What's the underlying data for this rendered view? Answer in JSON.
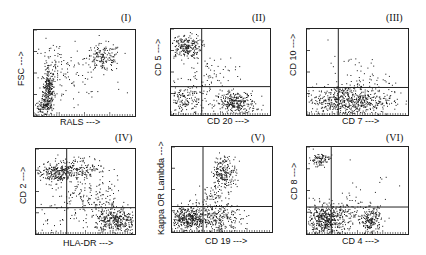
{
  "chart_data": [
    {
      "type": "scatter",
      "title": "(I)",
      "xlabel": "RALS --->",
      "ylabel": "FSC --->",
      "quadrants": false,
      "frame": {
        "x": 33,
        "y": 29,
        "w": 103,
        "h": 88
      },
      "clusters": [
        {
          "cx": 0.14,
          "cy": 0.3,
          "sx": 0.03,
          "sy": 0.13,
          "n": 260
        },
        {
          "cx": 0.08,
          "cy": 0.1,
          "sx": 0.05,
          "sy": 0.04,
          "n": 90
        },
        {
          "cx": 0.68,
          "cy": 0.68,
          "sx": 0.09,
          "sy": 0.08,
          "n": 170
        },
        {
          "cx": 0.2,
          "cy": 0.55,
          "sx": 0.1,
          "sy": 0.16,
          "n": 90
        },
        {
          "cx": 0.45,
          "cy": 0.4,
          "sx": 0.22,
          "sy": 0.2,
          "n": 35
        }
      ]
    },
    {
      "type": "scatter",
      "title": "(II)",
      "xlabel": "CD 20 --->",
      "ylabel": "CD 5 --->",
      "quadrants": true,
      "gate": {
        "x": 0.31,
        "y": 0.33
      },
      "frame": {
        "x": 170,
        "y": 28,
        "w": 101,
        "h": 88
      },
      "clusters": [
        {
          "cx": 0.14,
          "cy": 0.8,
          "sx": 0.08,
          "sy": 0.07,
          "n": 230
        },
        {
          "cx": 0.65,
          "cy": 0.14,
          "sx": 0.1,
          "sy": 0.07,
          "n": 300
        },
        {
          "cx": 0.14,
          "cy": 0.16,
          "sx": 0.1,
          "sy": 0.1,
          "n": 160
        },
        {
          "cx": 0.38,
          "cy": 0.45,
          "sx": 0.14,
          "sy": 0.14,
          "n": 80
        }
      ]
    },
    {
      "type": "scatter",
      "title": "(III)",
      "xlabel": "CD 7 --->",
      "ylabel": "CD 10 --->",
      "quadrants": true,
      "gate": {
        "x": 0.31,
        "y": 0.32
      },
      "frame": {
        "x": 306,
        "y": 28,
        "w": 103,
        "h": 88
      },
      "clusters": [
        {
          "cx": 0.4,
          "cy": 0.17,
          "sx": 0.22,
          "sy": 0.09,
          "n": 650
        },
        {
          "cx": 0.5,
          "cy": 0.45,
          "sx": 0.15,
          "sy": 0.12,
          "n": 60
        }
      ]
    },
    {
      "type": "scatter",
      "title": "(IV)",
      "xlabel": "HLA-DR --->",
      "ylabel": "CD 2 --->",
      "quadrants": true,
      "gate": {
        "x": 0.31,
        "y": 0.31
      },
      "frame": {
        "x": 35,
        "y": 148,
        "w": 101,
        "h": 87
      },
      "clusters": [
        {
          "cx": 0.18,
          "cy": 0.72,
          "sx": 0.1,
          "sy": 0.06,
          "n": 230
        },
        {
          "cx": 0.45,
          "cy": 0.78,
          "sx": 0.13,
          "sy": 0.06,
          "n": 160
        },
        {
          "cx": 0.8,
          "cy": 0.16,
          "sx": 0.1,
          "sy": 0.08,
          "n": 330
        },
        {
          "cx": 0.55,
          "cy": 0.4,
          "sx": 0.2,
          "sy": 0.15,
          "n": 200
        },
        {
          "cx": 0.15,
          "cy": 0.15,
          "sx": 0.08,
          "sy": 0.1,
          "n": 25
        }
      ]
    },
    {
      "type": "scatter",
      "title": "(V)",
      "xlabel": "CD 19 --->",
      "ylabel": "Kappa OR Lambda --->",
      "quadrants": true,
      "gate": {
        "x": 0.31,
        "y": 0.3
      },
      "frame": {
        "x": 171,
        "y": 146,
        "w": 102,
        "h": 87
      },
      "clusters": [
        {
          "cx": 0.16,
          "cy": 0.16,
          "sx": 0.1,
          "sy": 0.08,
          "n": 420
        },
        {
          "cx": 0.48,
          "cy": 0.16,
          "sx": 0.11,
          "sy": 0.08,
          "n": 220
        },
        {
          "cx": 0.52,
          "cy": 0.7,
          "sx": 0.06,
          "sy": 0.1,
          "n": 210
        },
        {
          "cx": 0.4,
          "cy": 0.42,
          "sx": 0.07,
          "sy": 0.08,
          "n": 60
        }
      ]
    },
    {
      "type": "scatter",
      "title": "(VI)",
      "xlabel": "CD 4 --->",
      "ylabel": "CD 8 --->",
      "quadrants": true,
      "gate": {
        "x": 0.24,
        "y": 0.31
      },
      "frame": {
        "x": 306,
        "y": 146,
        "w": 103,
        "h": 89
      },
      "clusters": [
        {
          "cx": 0.12,
          "cy": 0.86,
          "sx": 0.05,
          "sy": 0.04,
          "n": 90
        },
        {
          "cx": 0.18,
          "cy": 0.16,
          "sx": 0.11,
          "sy": 0.09,
          "n": 480
        },
        {
          "cx": 0.63,
          "cy": 0.16,
          "sx": 0.05,
          "sy": 0.08,
          "n": 200
        },
        {
          "cx": 0.38,
          "cy": 0.25,
          "sx": 0.12,
          "sy": 0.08,
          "n": 80
        },
        {
          "cx": 0.6,
          "cy": 0.55,
          "sx": 0.2,
          "sy": 0.18,
          "n": 15
        }
      ]
    }
  ],
  "style": {
    "dot_color": "#1a1a1a",
    "frame_color": "#222222",
    "background": "#ffffff"
  }
}
